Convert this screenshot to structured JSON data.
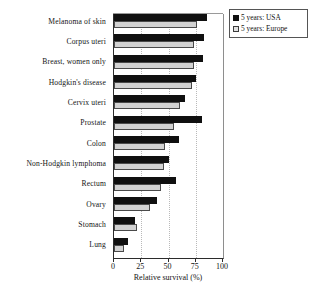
{
  "chart_data": {
    "type": "bar",
    "orientation": "horizontal",
    "title": "",
    "xlabel": "Relative survival (%)",
    "ylabel": "",
    "xlim": [
      0,
      100
    ],
    "xticks": [
      0,
      25,
      50,
      75,
      100
    ],
    "grid": "vertical dotted gridlines at 25, 50, 75",
    "legend_position": "top-right",
    "categories": [
      "Melanoma of skin",
      "Corpus uteri",
      "Breast, women only",
      "Hodgkin's disease",
      "Cervix uteri",
      "Prostate",
      "Colon",
      "Non-Hodgkin lymphoma",
      "Rectum",
      "Ovary",
      "Stomach",
      "Lung"
    ],
    "series": [
      {
        "name": "5 years: USA",
        "color": "#101010",
        "values": [
          85,
          83,
          82,
          75,
          65,
          81,
          60,
          50,
          57,
          39,
          19,
          13
        ]
      },
      {
        "name": "5 years: Europe",
        "color": "#d2d2d2",
        "values": [
          76,
          73,
          73,
          72,
          61,
          55,
          47,
          46,
          43,
          33,
          21,
          9
        ]
      }
    ]
  },
  "legend": {
    "items": [
      {
        "label": "5 years: USA",
        "swatch": "filled-black-square"
      },
      {
        "label": "5 years: Europe",
        "swatch": "outlined-light-square"
      }
    ]
  },
  "axis": {
    "x_title": "Relative survival (%)",
    "x_tick_labels": [
      "0",
      "25",
      "50",
      "75",
      "100"
    ]
  }
}
